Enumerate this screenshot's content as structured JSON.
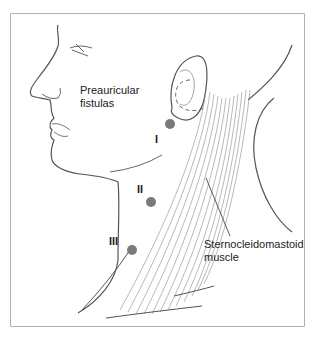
{
  "diagram": {
    "labels": {
      "preauricular_line1": "Preauricular",
      "preauricular_line2": "fistulas",
      "scm_line1": "Sternocleidomastoid",
      "scm_line2": "muscle"
    },
    "sites": [
      {
        "id": "I",
        "label": "I"
      },
      {
        "id": "II",
        "label": "II"
      },
      {
        "id": "III",
        "label": "III"
      }
    ],
    "colors": {
      "border": "#b0b0b0",
      "line": "#555555",
      "dot": "#7a7a7a",
      "muscle": "#8a8a8a"
    }
  }
}
